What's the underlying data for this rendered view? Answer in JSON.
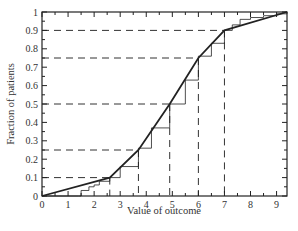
{
  "chart_data": {
    "type": "line",
    "title": "",
    "xlabel": "Value of outcome",
    "ylabel": "Fraction of patients",
    "xlim": [
      0,
      9.4
    ],
    "ylim": [
      0,
      1
    ],
    "xticks": [
      0,
      1,
      2,
      3,
      4,
      5,
      6,
      7,
      8,
      9
    ],
    "yticks": [
      0,
      0.1,
      0.2,
      0.3,
      0.4,
      0.5,
      0.6,
      0.7,
      0.8,
      0.9,
      1
    ],
    "ytick_labels": [
      "0",
      "0.1",
      "0.2",
      "0.3",
      "0.4",
      "0.5",
      "0.6",
      "0.7",
      "0.8",
      "0.9",
      "1"
    ],
    "grid": false,
    "legend": null,
    "series": [
      {
        "name": "Piecewise-linear fitted CDF",
        "style": "thick solid",
        "x": [
          0,
          2.6,
          3.7,
          4.9,
          6.0,
          7.0,
          9.4
        ],
        "y": [
          0,
          0.1,
          0.25,
          0.5,
          0.75,
          0.9,
          1.0
        ]
      },
      {
        "name": "Empirical CDF (step)",
        "style": "thin solid",
        "x": [
          0,
          1.4,
          1.5,
          1.8,
          2.0,
          2.2,
          2.6,
          3.0,
          3.7,
          4.2,
          4.9,
          5.5,
          6.0,
          6.5,
          7.0,
          7.3,
          7.6,
          8.0,
          8.5,
          9.0,
          9.4
        ],
        "y": [
          0,
          0.0,
          0.03,
          0.05,
          0.06,
          0.08,
          0.1,
          0.16,
          0.26,
          0.37,
          0.5,
          0.63,
          0.76,
          0.83,
          0.9,
          0.93,
          0.96,
          0.97,
          0.98,
          0.99,
          1.0
        ]
      }
    ],
    "annotations": {
      "quantile_guides": [
        {
          "y": 0.1,
          "x": 2.6
        },
        {
          "y": 0.25,
          "x": 3.7
        },
        {
          "y": 0.5,
          "x": 4.9
        },
        {
          "y": 0.75,
          "x": 6.0
        },
        {
          "y": 0.9,
          "x": 7.0
        }
      ],
      "guide_style": "dashed"
    }
  },
  "colors": {
    "axis": "#222222",
    "curve": "#222222",
    "guides": "#333333",
    "background": "#ffffff"
  }
}
